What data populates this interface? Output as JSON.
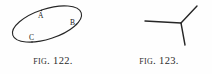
{
  "page": {
    "background_color": "#fefefe",
    "ink_color": "#262626"
  },
  "figures": [
    {
      "id": "fig-122",
      "caption_prefix": "Fig.",
      "caption_number": "122.",
      "caption_full": "Fig. 122.",
      "kind": "closed-curve",
      "description": "tilted ellipse with three marked points",
      "labels": [
        {
          "text": "A",
          "x": 38,
          "y": 12
        },
        {
          "text": "B",
          "x": 70,
          "y": 19
        },
        {
          "text": "C",
          "x": 29,
          "y": 34
        }
      ],
      "ellipse": {
        "cx": 47,
        "cy": 24,
        "rx": 36,
        "ry": 15,
        "rotation_deg": -18,
        "stroke_width": 1.1
      }
    },
    {
      "id": "fig-123",
      "caption_prefix": "Fig.",
      "caption_number": "123.",
      "caption_full": "Fig. 123.",
      "kind": "line-junction",
      "description": "three straight rays meeting at a common vertex",
      "labels": [],
      "vertex": {
        "x": 75,
        "y": 23
      },
      "rays": [
        {
          "name": "left-horizontal-ray",
          "x2": 39,
          "y2": 21
        },
        {
          "name": "upper-right-ray",
          "x2": 91,
          "y2": 6
        },
        {
          "name": "lower-ray",
          "x2": 79,
          "y2": 45
        }
      ],
      "stroke_width": 1.4
    }
  ]
}
